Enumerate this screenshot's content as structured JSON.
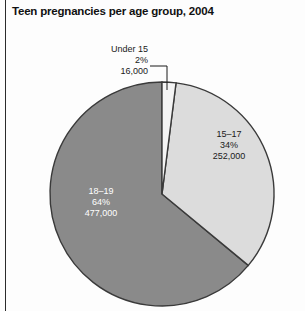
{
  "figure": {
    "title": "Teen pregnancies per age group, 2004"
  },
  "chart_data": {
    "type": "pie",
    "title": "Teen pregnancies per age group, 2004",
    "xlabel": "",
    "ylabel": "",
    "legend_position": "none",
    "grid": false,
    "total": 745000,
    "units": "pregnancies",
    "year": 2004,
    "categories": [
      "Under 15",
      "15–17",
      "18–19"
    ],
    "values": [
      16000,
      252000,
      477000
    ],
    "percentages": [
      2,
      34,
      64
    ],
    "start_angle_deg": 0,
    "direction": "clockwise",
    "slices": [
      {
        "label": "Under 15",
        "percent_text": "2%",
        "value_text": "16,000",
        "percent": 2,
        "value": 16000,
        "color": "#f4f4f4",
        "label_color": "#1a1a1a",
        "label_placement": "outside",
        "leader_line": true
      },
      {
        "label": "15–17",
        "percent_text": "34%",
        "value_text": "252,000",
        "percent": 34,
        "value": 252000,
        "color": "#dcdcdc",
        "label_color": "#1a1a1a",
        "label_placement": "inside",
        "leader_line": false
      },
      {
        "label": "18–19",
        "percent_text": "64%",
        "value_text": "477,000",
        "percent": 64,
        "value": 477000,
        "color": "#8a8a8a",
        "label_color": "#ffffff",
        "label_placement": "inside",
        "leader_line": false
      }
    ],
    "stroke_color": "#3a3a3a",
    "background": "#fdfdfd"
  }
}
